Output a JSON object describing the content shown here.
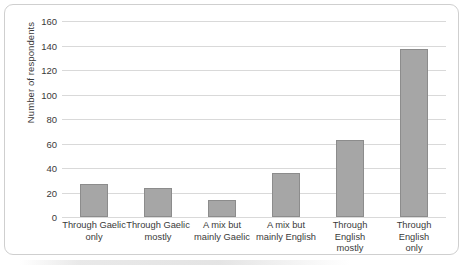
{
  "chart_data": {
    "type": "bar",
    "title": "",
    "xlabel": "",
    "ylabel": "Number of respondents",
    "ylim": [
      0,
      160
    ],
    "ytick_step": 20,
    "yticks": [
      160,
      140,
      120,
      100,
      80,
      60,
      40,
      20,
      0
    ],
    "grid": true,
    "legend": "none",
    "categories": [
      "Through Gaelic only",
      "Through Gaelic mostly",
      "A mix but mainly Gaelic",
      "A mix but mainly English",
      "Through English mostly",
      "Through English only"
    ],
    "category_lines": [
      {
        "line1": "Through Gaelic",
        "line2": "only"
      },
      {
        "line1": "Through Gaelic",
        "line2": "mostly"
      },
      {
        "line1": "A mix but",
        "line2": "mainly Gaelic"
      },
      {
        "line1": "A mix but",
        "line2": "mainly English"
      },
      {
        "line1": "Through English",
        "line2": "mostly"
      },
      {
        "line1": "Through English",
        "line2": "only"
      }
    ],
    "values": [
      27,
      24,
      14,
      36,
      63,
      137
    ],
    "colors": {
      "bar_fill": "#a6a6a6",
      "bar_border": "#8c8c8c",
      "gridline": "#d9d9d9",
      "text": "#3a3a3a",
      "frame_border": "#cfcfcf",
      "background": "#ffffff"
    }
  }
}
